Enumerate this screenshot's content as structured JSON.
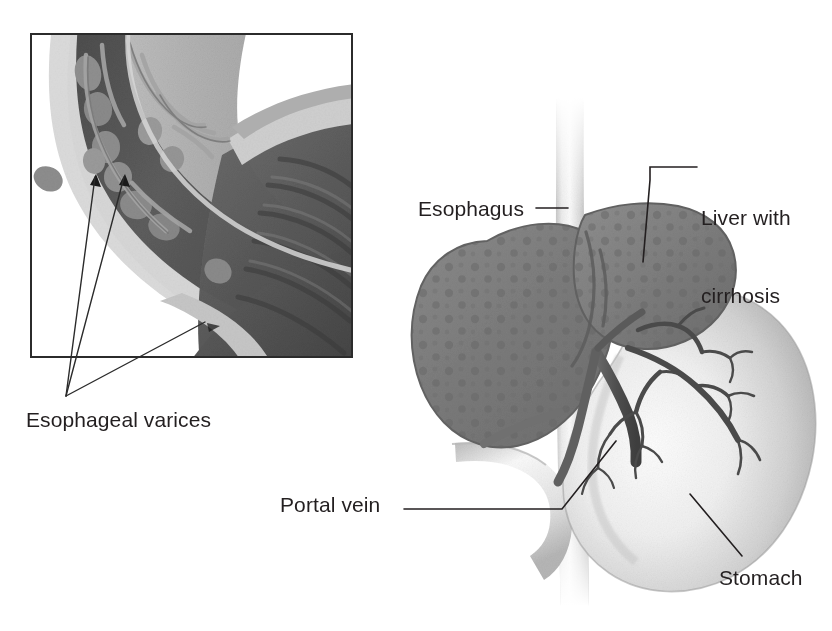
{
  "figure": {
    "background_color": "#ffffff",
    "width": 832,
    "height": 631,
    "style": "grayscale medical line illustration"
  },
  "inset": {
    "name": "esophageal-varices-detail",
    "description": "Framed cutaway detail of the lower esophagus and gastroesophageal junction showing dilated submucosal veins (varices) bulging into the lumen",
    "frame": {
      "x": 30,
      "y": 33,
      "width": 323,
      "height": 325,
      "border_color": "#2b2b2b",
      "border_width": 2
    },
    "arrow_count": 3,
    "arrow_targets": [
      {
        "x": 94,
        "y": 177
      },
      {
        "x": 123,
        "y": 177
      },
      {
        "x": 205,
        "y": 323
      }
    ],
    "arrow_origin": {
      "x": 66,
      "y": 396
    }
  },
  "labels": [
    {
      "id": "esophageal-varices",
      "text": "Esophageal varices",
      "x": 26,
      "y": 410,
      "align": "left",
      "lines": [
        "Esophageal varices"
      ]
    },
    {
      "id": "esophagus",
      "text": "Esophagus",
      "x": 418,
      "y": 198,
      "align": "left",
      "lines": [
        "Esophagus"
      ]
    },
    {
      "id": "liver-with-cirrhosis",
      "text": "Liver with cirrhosis",
      "x": 700,
      "y": 155,
      "align": "left",
      "lines": [
        "Liver with",
        "cirrhosis"
      ]
    },
    {
      "id": "portal-vein",
      "text": "Portal vein",
      "x": 280,
      "y": 494,
      "align": "left",
      "lines": [
        "Portal vein"
      ]
    },
    {
      "id": "stomach",
      "text": "Stomach",
      "x": 719,
      "y": 567,
      "align": "left",
      "lines": [
        "Stomach"
      ]
    }
  ],
  "leader_lines": [
    {
      "id": "esophagus-leader",
      "from": [
        534,
        208
      ],
      "to": [
        566,
        208
      ]
    },
    {
      "id": "liver-leader",
      "from": [
        697,
        167
      ],
      "to": [
        660,
        167
      ],
      "elbow": [
        640,
        167,
        640,
        258
      ]
    },
    {
      "id": "portal-vein-leader",
      "from": [
        404,
        507
      ],
      "to": [
        560,
        507
      ],
      "elbow": [
        560,
        507,
        608,
        448
      ]
    },
    {
      "id": "stomach-leader",
      "from": [
        742,
        556
      ],
      "to": [
        692,
        497
      ]
    }
  ],
  "anatomy": {
    "esophagus": {
      "name": "esophagus-tube",
      "color_light": "#f2f2f2",
      "color_mid": "#c9c9c9",
      "color_shadow": "#9a9a9a"
    },
    "liver": {
      "name": "liver-with-cirrhosis",
      "fill": "#7d7d7d",
      "nodule_fill": "#6a6a6a",
      "edge": "#6b6b6b",
      "lobes": 2,
      "texture": "nodular-cirrhotic"
    },
    "stomach": {
      "name": "stomach",
      "fill_light": "#fbfbfb",
      "fill_mid": "#d8d8d8",
      "fill_dark": "#a9a9a9"
    },
    "duodenum": {
      "name": "duodenum",
      "fill_light": "#fdfdfd",
      "fill_mid": "#dcdcdc"
    },
    "portal_vein": {
      "name": "portal-vein",
      "color": "#555555",
      "branch_color": "#4a4a4a",
      "description": "dark branching vessel running from the gastric wall up into the liver hilum"
    },
    "gastric_vessels": {
      "name": "gastric-vessel-branches",
      "color": "#4a4a4a",
      "branch_count": 9
    }
  },
  "inset_anatomy": {
    "lumen": {
      "name": "esophageal-lumen",
      "fill": "#595959"
    },
    "mucosal_folds": {
      "name": "mucosal-folds",
      "fill": "#4a4a4a",
      "count": 7
    },
    "wall_outer": {
      "name": "outer-wall",
      "fill": "#b4b4b4"
    },
    "wall_inner": {
      "name": "inner-wall",
      "fill": "#8e8e8e"
    },
    "varices": {
      "name": "varices-bulges",
      "fill": "#8a8a8a",
      "count": 8
    },
    "vessel_network": {
      "name": "submucosal-vessels",
      "color": "#9c9c9c"
    }
  }
}
